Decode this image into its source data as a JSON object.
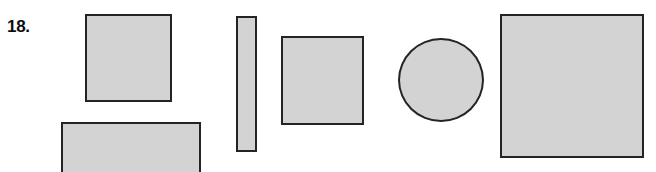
{
  "figure": {
    "item_label": "18.",
    "background_color": "#ffffff",
    "shape_fill_color": "#d3d3d3",
    "shape_border_color": "#242424",
    "shapes": [
      {
        "name": "square-large-left",
        "type": "square",
        "x": 85,
        "y": 14,
        "width": 87,
        "height": 88
      },
      {
        "name": "rectangle-wide-bottom",
        "type": "rectangle",
        "x": 61,
        "y": 122,
        "width": 140,
        "height": 52
      },
      {
        "name": "rectangle-tall-narrow",
        "type": "rectangle",
        "x": 236,
        "y": 16,
        "width": 21,
        "height": 136
      },
      {
        "name": "square-medium",
        "type": "square",
        "x": 281,
        "y": 36,
        "width": 83,
        "height": 89
      },
      {
        "name": "circle",
        "type": "circle",
        "x": 398,
        "y": 38,
        "width": 86,
        "height": 84
      },
      {
        "name": "square-largest-right",
        "type": "square",
        "x": 500,
        "y": 14,
        "width": 144,
        "height": 144
      }
    ]
  }
}
